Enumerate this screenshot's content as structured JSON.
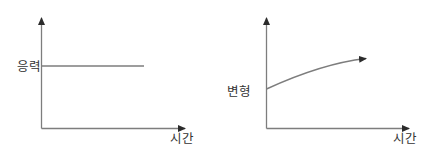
{
  "colors": {
    "line": "#7d7d7d",
    "arrow": "#2b2b2b",
    "text": "#333333",
    "background": "#ffffff"
  },
  "charts": [
    {
      "id": "stress-vs-time",
      "type": "line",
      "x_axis_label": "시간",
      "y_axis_label": "응력",
      "series": [
        {
          "name": "응력",
          "shape": "constant horizontal line starting at the y-axis, no arrowhead"
        }
      ]
    },
    {
      "id": "strain-vs-time",
      "type": "line",
      "x_axis_label": "시간",
      "y_axis_label": "변형",
      "series": [
        {
          "name": "변형",
          "shape": "increasing concave-down curve starting at the y-axis, ending in an arrowhead"
        }
      ]
    }
  ]
}
